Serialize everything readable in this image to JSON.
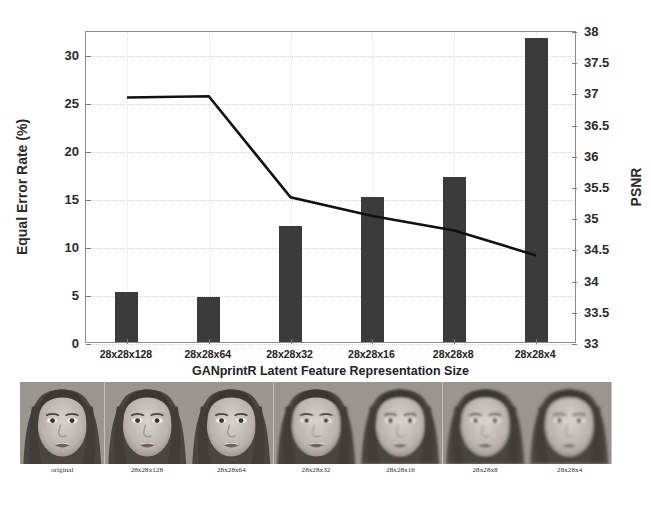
{
  "chart_data": {
    "type": "bar",
    "title": "",
    "xlabel": "GANprintR Latent Feature Representation Size",
    "ylabel": "Equal Error Rate (%)",
    "y2label": "PSNR",
    "categories": [
      "28x28x128",
      "28x28x64",
      "28x28x32",
      "28x28x16",
      "28x28x8",
      "28x28x4"
    ],
    "ylim": [
      0,
      32.5
    ],
    "y2lim": [
      33,
      38
    ],
    "yticks": [
      "0",
      "5",
      "10",
      "15",
      "20",
      "25",
      "30"
    ],
    "ytick_values": [
      0,
      5,
      10,
      15,
      20,
      25,
      30
    ],
    "y2ticks": [
      "33",
      "33.5",
      "34",
      "34.5",
      "35",
      "35.5",
      "36",
      "36.5",
      "37",
      "37.5",
      "38"
    ],
    "y2tick_values": [
      33,
      33.5,
      34,
      34.5,
      35,
      35.5,
      36,
      36.5,
      37,
      37.5,
      38
    ],
    "grid": true,
    "legend": "none",
    "series": [
      {
        "name": "Equal Error Rate (%)",
        "kind": "bar",
        "axis": "left",
        "color": "#3b3b3b",
        "values": [
          5.2,
          4.7,
          12.1,
          15.1,
          17.2,
          31.7
        ]
      },
      {
        "name": "PSNR",
        "kind": "line",
        "axis": "right",
        "color": "#111111",
        "values": [
          36.95,
          36.97,
          35.35,
          35.05,
          34.82,
          34.42
        ]
      }
    ]
  },
  "strip": {
    "captions": [
      "original",
      "28x28x128",
      "28x28x64",
      "28x28x32",
      "28x28x16",
      "28x28x8",
      "28x28x4"
    ]
  }
}
